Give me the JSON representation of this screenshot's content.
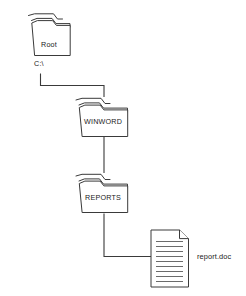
{
  "diagram": {
    "background_color": "#ffffff",
    "stroke_color": "#3a3a3a",
    "text_color": "#1a1a1a",
    "nodes": [
      {
        "id": "root",
        "icon": "folder-icon",
        "label": "Root",
        "sublabel": "C:\\"
      },
      {
        "id": "winword",
        "icon": "folder-icon",
        "label": "WINWORD",
        "sublabel": ""
      },
      {
        "id": "reports",
        "icon": "folder-icon",
        "label": "REPORTS",
        "sublabel": ""
      },
      {
        "id": "reportdoc",
        "icon": "document-icon",
        "label": "report.doc",
        "sublabel": ""
      }
    ],
    "connectors": [
      {
        "from": "root",
        "to": "winword"
      },
      {
        "from": "winword",
        "to": "reports"
      },
      {
        "from": "reports",
        "to": "reportdoc"
      }
    ]
  }
}
